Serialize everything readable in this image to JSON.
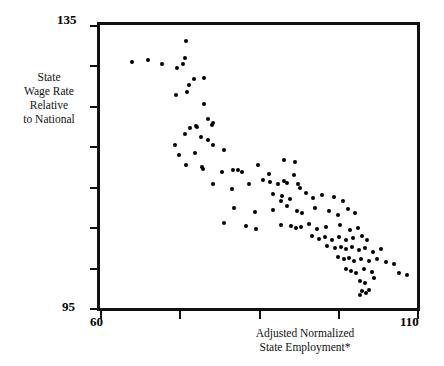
{
  "chart_data": {
    "type": "scatter",
    "title": "",
    "subtitle": "",
    "xlabel": "Adjusted Normalized State Employment*",
    "xlabel_lines": [
      "Adjusted Normalized",
      "State Employment*"
    ],
    "ylabel": "State Wage Rate Relative to National",
    "ylabel_lines": [
      "State",
      "Wage Rate",
      "Relative",
      "to National"
    ],
    "xlim": [
      60,
      110
    ],
    "ylim": [
      95,
      135
    ],
    "xticks_labeled": [
      "60",
      "110"
    ],
    "yticks_labeled": [
      "135",
      "95"
    ],
    "x_tick_count": 5,
    "y_tick_count": 8,
    "grid": false,
    "legend": "none",
    "marker_color": "#000000",
    "frame_color": "#111111",
    "footnote_marker": "*",
    "points": [
      [
        64.6,
        130.2
      ],
      [
        67.1,
        130.5
      ],
      [
        69.3,
        129.9
      ],
      [
        73.1,
        133.2
      ],
      [
        72.9,
        130.7
      ],
      [
        72.6,
        129.9
      ],
      [
        71.7,
        129.4
      ],
      [
        74.4,
        127.8
      ],
      [
        73.6,
        126.9
      ],
      [
        75.9,
        128.0
      ],
      [
        73.2,
        126.0
      ],
      [
        71.5,
        125.6
      ],
      [
        75.9,
        124.3
      ],
      [
        76.6,
        122.2
      ],
      [
        77.4,
        121.6
      ],
      [
        77.2,
        121.3
      ],
      [
        73.7,
        120.9
      ],
      [
        74.6,
        121.2
      ],
      [
        74.9,
        121.0
      ],
      [
        72.9,
        120.0
      ],
      [
        75.4,
        119.6
      ],
      [
        76.6,
        119.2
      ],
      [
        71.4,
        118.5
      ],
      [
        72.0,
        117.0
      ],
      [
        74.5,
        117.4
      ],
      [
        77.4,
        118.4
      ],
      [
        79.1,
        117.8
      ],
      [
        73.1,
        115.6
      ],
      [
        75.6,
        115.4
      ],
      [
        75.8,
        115.1
      ],
      [
        78.8,
        114.6
      ],
      [
        80.5,
        114.9
      ],
      [
        81.3,
        115.0
      ],
      [
        82.0,
        114.7
      ],
      [
        84.5,
        115.6
      ],
      [
        86.2,
        114.3
      ],
      [
        85.3,
        113.5
      ],
      [
        88.6,
        116.4
      ],
      [
        90.3,
        116.0
      ],
      [
        77.3,
        113.0
      ],
      [
        80.3,
        112.2
      ],
      [
        83.1,
        112.9
      ],
      [
        86.4,
        113.3
      ],
      [
        87.6,
        113.0
      ],
      [
        88.5,
        113.4
      ],
      [
        89.1,
        113.1
      ],
      [
        90.1,
        114.2
      ],
      [
        90.7,
        113.0
      ],
      [
        91.0,
        112.4
      ],
      [
        86.8,
        111.6
      ],
      [
        88.2,
        111.2
      ],
      [
        88.0,
        110.6
      ],
      [
        89.5,
        110.9
      ],
      [
        92.0,
        111.7
      ],
      [
        93.2,
        111.0
      ],
      [
        94.6,
        111.4
      ],
      [
        96.4,
        111.1
      ],
      [
        97.8,
        110.6
      ],
      [
        80.6,
        109.6
      ],
      [
        83.9,
        109.0
      ],
      [
        86.8,
        109.3
      ],
      [
        89.0,
        109.8
      ],
      [
        90.6,
        109.2
      ],
      [
        91.4,
        108.8
      ],
      [
        93.5,
        109.5
      ],
      [
        95.6,
        109.1
      ],
      [
        97.0,
        108.5
      ],
      [
        98.6,
        109.4
      ],
      [
        99.8,
        108.8
      ],
      [
        79.1,
        107.4
      ],
      [
        82.6,
        107.0
      ],
      [
        84.2,
        106.6
      ],
      [
        88.0,
        107.2
      ],
      [
        89.6,
        107.0
      ],
      [
        90.4,
        106.7
      ],
      [
        91.2,
        106.9
      ],
      [
        92.5,
        107.3
      ],
      [
        93.8,
        106.6
      ],
      [
        95.2,
        106.9
      ],
      [
        97.4,
        107.1
      ],
      [
        98.9,
        106.4
      ],
      [
        100.2,
        106.8
      ],
      [
        92.9,
        105.6
      ],
      [
        94.0,
        105.2
      ],
      [
        95.0,
        105.4
      ],
      [
        96.1,
        105.1
      ],
      [
        97.2,
        105.5
      ],
      [
        98.4,
        105.0
      ],
      [
        99.5,
        105.3
      ],
      [
        100.8,
        105.6
      ],
      [
        101.6,
        105.0
      ],
      [
        95.4,
        104.2
      ],
      [
        96.6,
        103.9
      ],
      [
        97.5,
        104.1
      ],
      [
        98.3,
        103.7
      ],
      [
        99.2,
        104.0
      ],
      [
        100.4,
        103.6
      ],
      [
        101.3,
        103.9
      ],
      [
        102.6,
        103.4
      ],
      [
        103.8,
        103.7
      ],
      [
        97.1,
        102.6
      ],
      [
        98.0,
        102.3
      ],
      [
        98.8,
        102.5
      ],
      [
        99.6,
        102.1
      ],
      [
        100.7,
        102.4
      ],
      [
        102.0,
        102.0
      ],
      [
        103.2,
        102.3
      ],
      [
        104.6,
        101.9
      ],
      [
        105.9,
        101.6
      ],
      [
        98.3,
        101.0
      ],
      [
        99.1,
        100.7
      ],
      [
        99.9,
        100.4
      ],
      [
        101.2,
        100.9
      ],
      [
        102.4,
        100.5
      ],
      [
        106.7,
        100.4
      ],
      [
        107.9,
        100.1
      ],
      [
        100.5,
        99.2
      ],
      [
        101.4,
        98.9
      ],
      [
        102.8,
        99.6
      ],
      [
        100.9,
        97.8
      ],
      [
        101.5,
        97.5
      ],
      [
        101.9,
        97.9
      ],
      [
        100.6,
        97.2
      ]
    ]
  }
}
